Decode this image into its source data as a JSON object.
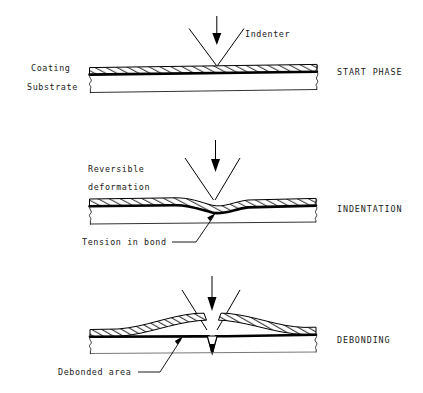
{
  "figure": {
    "title_caption": "",
    "background_color": "#ffffff",
    "ink_color": "#000000",
    "panels": [
      {
        "id": "start-phase",
        "stage_label": "START PHASE",
        "left_labels": [
          "Coating",
          "Substrate"
        ],
        "annotations": [
          "Indenter"
        ],
        "description_visual": "flat hatched coating over substrate, indenter tip touching surface"
      },
      {
        "id": "indentation",
        "stage_label": "INDENTATION",
        "left_labels": [],
        "annotations": [
          "Reversible",
          "deformation",
          "Tension in bond"
        ],
        "description_visual": "coating and bond line dished downward under indenter tip"
      },
      {
        "id": "debonding",
        "stage_label": "DEBONDING",
        "left_labels": [],
        "annotations": [
          "Debonded area"
        ],
        "description_visual": "coating buckled up on both sides, sharp V notch through bond into substrate"
      }
    ]
  },
  "panel1": {
    "stage": "START PHASE",
    "coating_label": "Coating",
    "substrate_label": "Substrate",
    "indenter_label": "Indenter"
  },
  "panel2": {
    "stage": "INDENTATION",
    "reversible_line1": "Reversible",
    "reversible_line2": "deformation",
    "tension_label": "Tension in bond"
  },
  "panel3": {
    "stage": "DEBONDING",
    "debonded_label": "Debonded area"
  },
  "footer": {
    "caption": ""
  },
  "colors": {
    "ink": "#000000",
    "paper": "#ffffff",
    "faint_rule": "#555555"
  }
}
